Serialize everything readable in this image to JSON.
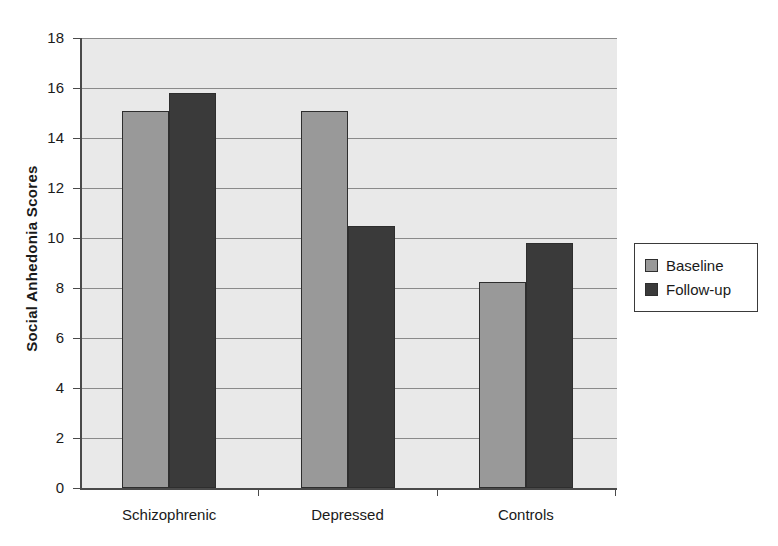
{
  "chart_data": {
    "type": "bar",
    "title": "",
    "xlabel": "",
    "ylabel": "Social Anhedonia Scores",
    "categories": [
      "Schizophrenic",
      "Depressed",
      "Controls"
    ],
    "series": [
      {
        "name": "Baseline",
        "color": "#999999",
        "values": [
          15.1,
          15.1,
          8.25
        ]
      },
      {
        "name": "Follow-up",
        "color": "#3a3a3a",
        "values": [
          15.8,
          10.5,
          9.8
        ]
      }
    ],
    "ylim": [
      0,
      18
    ],
    "ytick_step": 2,
    "yticks": [
      "18",
      "16",
      "14",
      "12",
      "10",
      "8",
      "6",
      "4",
      "2",
      "0"
    ],
    "grid": true,
    "legend_position": "right",
    "plot_background": "#e9e9e9",
    "axis_color": "#4a4a4a",
    "gridline_color": "#8a8a8a"
  },
  "legend": {
    "items": [
      {
        "label": "Baseline"
      },
      {
        "label": "Follow-up"
      }
    ]
  }
}
